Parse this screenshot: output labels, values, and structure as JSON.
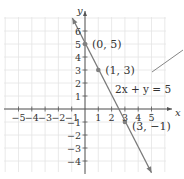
{
  "chart_data": {
    "type": "line",
    "title": "",
    "xlabel": "x",
    "ylabel": "y",
    "xlim": [
      -6,
      6
    ],
    "ylim": [
      -5,
      7
    ],
    "grid": true,
    "x_ticks": [
      -5,
      -4,
      -3,
      -2,
      -1,
      1,
      2,
      3,
      4,
      5
    ],
    "y_ticks": [
      -4,
      -3,
      -2,
      -1,
      1,
      2,
      3,
      4,
      5,
      6
    ],
    "x_tick_labels": [
      "−5",
      "−4",
      "−3",
      "−2",
      "−1",
      "1",
      "2",
      "3",
      "4",
      "5"
    ],
    "y_tick_labels": [
      "−4",
      "−3",
      "−2",
      "−1",
      "1",
      "2",
      "3",
      "4",
      "5",
      "6"
    ],
    "series": [
      {
        "name": "2x + y = 5",
        "equation": "2x + y = 5",
        "x": [
          -1,
          5
        ],
        "y": [
          7,
          -5
        ],
        "arrows": "both"
      }
    ],
    "points": [
      {
        "x": 0,
        "y": 5,
        "label": "(0, 5)"
      },
      {
        "x": 1,
        "y": 3,
        "label": "(1, 3)"
      },
      {
        "x": 3,
        "y": -1,
        "label": "(3, −1)"
      }
    ],
    "annotations": [
      {
        "text": "2x + y = 5",
        "type": "equation-label"
      },
      {
        "type": "pointer-line"
      }
    ]
  },
  "colors": {
    "line": "#7a7a7a",
    "axis": "#555555",
    "grid": "#e4e4e4",
    "point": "#808080"
  }
}
